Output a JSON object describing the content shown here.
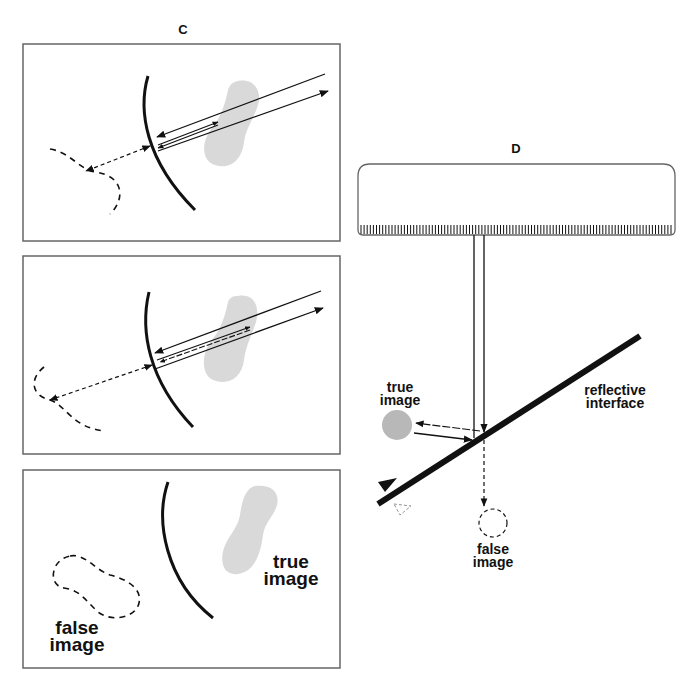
{
  "figure": {
    "panel_c": {
      "label": "C",
      "subpanels": [
        {
          "id": "c1",
          "description": "reflection at curved interface, false image location"
        },
        {
          "id": "c2",
          "description": "multiple reflections at curved interface"
        },
        {
          "id": "c3",
          "description": "true image vs false image positions",
          "true_image_label": [
            "true",
            "image"
          ],
          "false_image_label": [
            "false",
            "image"
          ]
        }
      ]
    },
    "panel_d": {
      "label": "D",
      "true_image_label": [
        "true",
        "image"
      ],
      "false_image_label": [
        "false",
        "image"
      ],
      "interface_label": [
        "reflective",
        "interface"
      ]
    },
    "colors": {
      "line": "#111111",
      "border": "#666666",
      "true_image_fill": "#d9d9d9",
      "true_image_fill_d": "#b8b8b8"
    }
  }
}
